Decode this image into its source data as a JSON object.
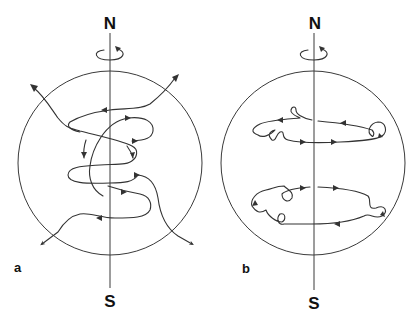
{
  "panels": [
    {
      "id": "a",
      "label": "a",
      "north_label": "N",
      "south_label": "S",
      "description": "Field lines entering and exiting the sphere, winding around the rotation axis"
    },
    {
      "id": "b",
      "label": "b",
      "north_label": "N",
      "south_label": "S",
      "description": "Closed toroidal field loops confined inside the sphere, with small twists"
    }
  ],
  "colors": {
    "line": "#333333",
    "text": "#111111",
    "background": "#ffffff"
  }
}
